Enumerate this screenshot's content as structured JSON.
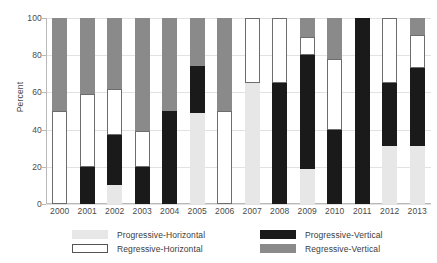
{
  "chart_data": {
    "type": "bar",
    "subtype": "stacked-bar-100-percent",
    "title": "",
    "subtitle": "",
    "xlabel": "",
    "ylabel": "Percent",
    "ylim": [
      0,
      100
    ],
    "yticks": [
      0,
      20,
      40,
      60,
      80,
      100
    ],
    "ytick_labels": [
      "0",
      "20",
      "40",
      "60",
      "80",
      "100"
    ],
    "grid": true,
    "grid_axis": "y",
    "legend_position": "bottom",
    "categories": [
      "2000",
      "2001",
      "2002",
      "2003",
      "2004",
      "2005",
      "2006",
      "2007",
      "2008",
      "2009",
      "2010",
      "2011",
      "2012",
      "2013"
    ],
    "series": [
      {
        "name": "Progressive-Horizontal",
        "color": "#e7e7e7",
        "edge": "#e7e7e7",
        "values": [
          0,
          0,
          10,
          0,
          0,
          49,
          0,
          65,
          0,
          19,
          0,
          0,
          31,
          31
        ]
      },
      {
        "name": "Progressive-Vertical",
        "color": "#1a1a1a",
        "edge": "#1a1a1a",
        "values": [
          0,
          20,
          27,
          20,
          50,
          25,
          0,
          0,
          65,
          61,
          40,
          100,
          34,
          42
        ]
      },
      {
        "name": "Regressive-Horizontal",
        "color": "#ffffff",
        "edge": "#6d6d6d",
        "values": [
          50,
          39,
          25,
          19,
          0,
          0,
          50,
          35,
          35,
          10,
          38,
          0,
          35,
          18
        ]
      },
      {
        "name": "Regressive-Vertical",
        "color": "#8a8a8a",
        "edge": "#8a8a8a",
        "values": [
          50,
          41,
          38,
          61,
          50,
          26,
          50,
          0,
          0,
          10,
          22,
          0,
          0,
          9
        ]
      }
    ],
    "stack_order_bottom_to_top": [
      "Progressive-Horizontal",
      "Progressive-Vertical",
      "Regressive-Horizontal",
      "Regressive-Vertical"
    ],
    "bar_tops_by_year": {
      "2000": [
        {
          "series": "Regressive-Horizontal",
          "from": 0,
          "to": 50
        },
        {
          "series": "Regressive-Vertical",
          "from": 50,
          "to": 100
        }
      ],
      "2001": [
        {
          "series": "Progressive-Vertical",
          "from": 0,
          "to": 20
        },
        {
          "series": "Regressive-Horizontal",
          "from": 20,
          "to": 59
        },
        {
          "series": "Regressive-Vertical",
          "from": 59,
          "to": 100
        }
      ],
      "2002": [
        {
          "series": "Progressive-Horizontal",
          "from": 0,
          "to": 10
        },
        {
          "series": "Progressive-Vertical",
          "from": 10,
          "to": 37
        },
        {
          "series": "Regressive-Horizontal",
          "from": 37,
          "to": 62
        },
        {
          "series": "Regressive-Vertical",
          "from": 62,
          "to": 100
        }
      ],
      "2003": [
        {
          "series": "Progressive-Vertical",
          "from": 0,
          "to": 20
        },
        {
          "series": "Regressive-Horizontal",
          "from": 20,
          "to": 39
        },
        {
          "series": "Regressive-Vertical",
          "from": 39,
          "to": 100
        }
      ],
      "2004": [
        {
          "series": "Progressive-Vertical",
          "from": 0,
          "to": 50
        },
        {
          "series": "Regressive-Vertical",
          "from": 50,
          "to": 100
        }
      ],
      "2005": [
        {
          "series": "Progressive-Horizontal",
          "from": 0,
          "to": 49
        },
        {
          "series": "Progressive-Vertical",
          "from": 49,
          "to": 74
        },
        {
          "series": "Regressive-Vertical",
          "from": 74,
          "to": 100
        }
      ],
      "2006": [
        {
          "series": "Regressive-Horizontal",
          "from": 0,
          "to": 50
        },
        {
          "series": "Regressive-Vertical",
          "from": 50,
          "to": 100
        }
      ],
      "2007": [
        {
          "series": "Progressive-Horizontal",
          "from": 0,
          "to": 65
        },
        {
          "series": "Regressive-Horizontal",
          "from": 65,
          "to": 100
        }
      ],
      "2008": [
        {
          "series": "Progressive-Vertical",
          "from": 0,
          "to": 65
        },
        {
          "series": "Regressive-Horizontal",
          "from": 65,
          "to": 100
        }
      ],
      "2009": [
        {
          "series": "Progressive-Horizontal",
          "from": 0,
          "to": 19
        },
        {
          "series": "Progressive-Vertical",
          "from": 19,
          "to": 80
        },
        {
          "series": "Regressive-Horizontal",
          "from": 80,
          "to": 90
        },
        {
          "series": "Regressive-Vertical",
          "from": 90,
          "to": 100
        }
      ],
      "2010": [
        {
          "series": "Progressive-Vertical",
          "from": 0,
          "to": 40
        },
        {
          "series": "Regressive-Horizontal",
          "from": 40,
          "to": 78
        },
        {
          "series": "Regressive-Vertical",
          "from": 78,
          "to": 100
        }
      ],
      "2011": [
        {
          "series": "Progressive-Vertical",
          "from": 0,
          "to": 100
        }
      ],
      "2012": [
        {
          "series": "Progressive-Horizontal",
          "from": 0,
          "to": 31
        },
        {
          "series": "Progressive-Vertical",
          "from": 31,
          "to": 65
        },
        {
          "series": "Regressive-Horizontal",
          "from": 65,
          "to": 100
        }
      ],
      "2013": [
        {
          "series": "Progressive-Horizontal",
          "from": 0,
          "to": 31
        },
        {
          "series": "Progressive-Vertical",
          "from": 31,
          "to": 73
        },
        {
          "series": "Regressive-Horizontal",
          "from": 73,
          "to": 91
        },
        {
          "series": "Regressive-Vertical",
          "from": 91,
          "to": 100
        }
      ]
    }
  },
  "legend": {
    "items": [
      {
        "label": "Progressive-Horizontal",
        "color": "#e7e7e7",
        "edge": "#e7e7e7",
        "col": 0,
        "row": 0
      },
      {
        "label": "Regressive-Horizontal",
        "color": "#ffffff",
        "edge": "#555555",
        "col": 0,
        "row": 1
      },
      {
        "label": "Progressive-Vertical",
        "color": "#1a1a1a",
        "edge": "#1a1a1a",
        "col": 1,
        "row": 0
      },
      {
        "label": "Regressive-Vertical",
        "color": "#8a8a8a",
        "edge": "#8a8a8a",
        "col": 1,
        "row": 1
      }
    ]
  },
  "colors": {
    "progressive_horizontal": "#e7e7e7",
    "progressive_vertical": "#1a1a1a",
    "regressive_horizontal": "#ffffff",
    "regressive_vertical": "#8a8a8a",
    "axis": "#b9b9b9",
    "grid": "#e2e2e2",
    "text": "#4a4a4a",
    "background": "#ffffff"
  }
}
